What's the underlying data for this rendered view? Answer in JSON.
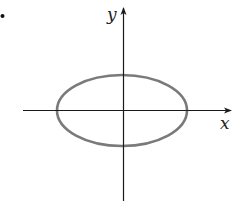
{
  "figure": {
    "bullet": "•",
    "axes": {
      "x_label": "x",
      "y_label": "y",
      "color": "#1a1a1a"
    },
    "ellipse": {
      "shape": "ellipse",
      "center": [
        0,
        0
      ],
      "horizontal_semi_axis_px": 65,
      "vertical_semi_axis_px": 35,
      "stroke_color": "#7a7a7a"
    }
  }
}
